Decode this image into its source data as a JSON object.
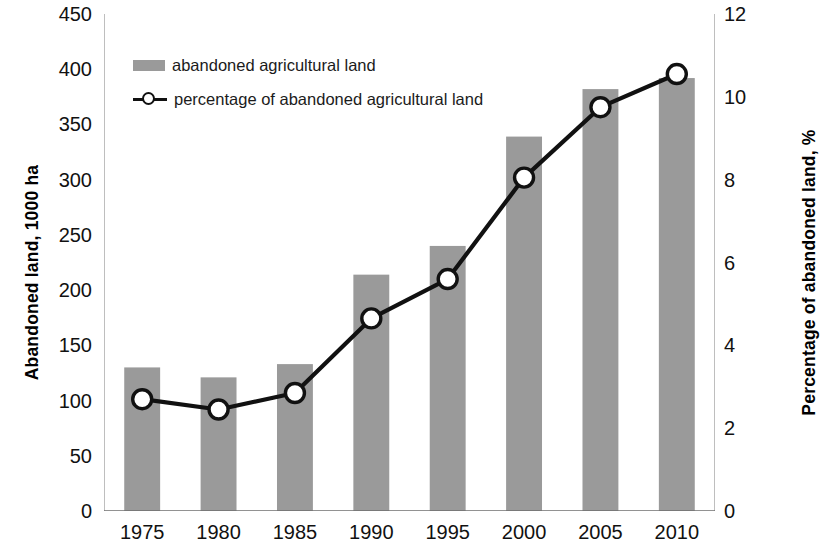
{
  "chart_data": {
    "type": "bar",
    "title": "",
    "xlabel": "",
    "ylabel": "Abandoned land, 1000 ha",
    "y2label": "Percentage of abandoned land, %",
    "categories": [
      "1975",
      "1980",
      "1985",
      "1990",
      "1995",
      "2000",
      "2005",
      "2010"
    ],
    "ylim": [
      0,
      450
    ],
    "y2lim": [
      0,
      12
    ],
    "yticks": [
      "0",
      "50",
      "100",
      "150",
      "200",
      "250",
      "300",
      "350",
      "400",
      "450"
    ],
    "y2ticks": [
      "0",
      "2",
      "4",
      "6",
      "8",
      "10",
      "12"
    ],
    "grid": false,
    "legend_position": "upper-left-inside",
    "series": [
      {
        "name": "abandoned agricultural land",
        "type": "bar",
        "axis": "left",
        "color": "#9a9a9a",
        "values": [
          130,
          121,
          133,
          214,
          240,
          339,
          382,
          392
        ]
      },
      {
        "name": "percentage of abandoned agricultural land",
        "type": "line",
        "axis": "right",
        "color": "#111111",
        "marker": "circle-open",
        "values": [
          2.7,
          2.45,
          2.85,
          4.65,
          5.6,
          8.05,
          9.75,
          10.55
        ]
      }
    ]
  },
  "legend": {
    "items": [
      {
        "label": "abandoned agricultural land"
      },
      {
        "label": "percentage of abandoned agricultural land"
      }
    ]
  }
}
